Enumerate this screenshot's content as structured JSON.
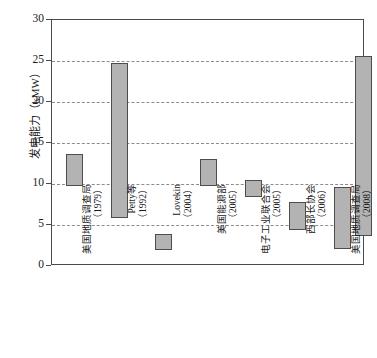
{
  "chart_data": {
    "type": "bar",
    "title": "",
    "subtitle": "",
    "xlabel": "",
    "ylabel": "发电能力（kMW）",
    "ylim": [
      0,
      30
    ],
    "yticks": [
      0,
      5,
      10,
      15,
      20,
      25,
      30
    ],
    "ytick_labels": [
      "0",
      "5",
      "10",
      "15",
      "20",
      "25",
      "30"
    ],
    "grid": true,
    "grid_axis": "y",
    "legend": false,
    "bar_style": "floating-range",
    "note": "Each bar is a floating range bar showing a low and high estimate.",
    "categories": [
      "美国地质调查局（1979）",
      "Petty等（1992）",
      "Lovekin（2004）",
      "美国能源部（2005）",
      "电子工业联合会（2005）",
      "西部长协会（2006）",
      "美国地质调查局（2008）"
    ],
    "category_lines": [
      {
        "name": "美国地质调查局",
        "year": "（1979）"
      },
      {
        "name": "Petty等",
        "year": "（1992）"
      },
      {
        "name": "Lovekin",
        "year": "（2004）"
      },
      {
        "name": "美国能源部",
        "year": "（2005）"
      },
      {
        "name": "电子工业联合会",
        "year": "（2005）"
      },
      {
        "name": "西部长协会",
        "year": "（2006）"
      },
      {
        "name": "美国地质调查局",
        "year": "（2008）"
      }
    ],
    "series": [
      {
        "name": "低值",
        "values": [
          9.7,
          5.8,
          1.9,
          9.8,
          8.4,
          4.4,
          2.1
        ]
      },
      {
        "name": "高值",
        "values": [
          13.6,
          24.7,
          3.9,
          13.0,
          10.5,
          7.8,
          9.6
        ]
      }
    ],
    "bars": [
      {
        "category": "美国地质调查局（1979）",
        "low": 9.7,
        "high": 13.6
      },
      {
        "category": "Petty等（1992）",
        "low": 5.8,
        "high": 24.7
      },
      {
        "category": "Lovekin（2004）",
        "low": 1.9,
        "high": 3.9
      },
      {
        "category": "美国能源部（2005）",
        "low": 9.8,
        "high": 13.0
      },
      {
        "category": "电子工业联合会（2005）",
        "low": 8.4,
        "high": 10.5
      },
      {
        "category": "西部长协会（2006）",
        "low": 4.4,
        "high": 7.8
      },
      {
        "category": "美国地质调查局（2008）",
        "low": 2.1,
        "high": 9.6
      }
    ],
    "extra_bar": {
      "category": "美国地质调查局（2008）",
      "low": 3.7,
      "high": 25.6
    },
    "colors": {
      "bar_fill": "#b3b3b3",
      "bar_border": "#4d4d4d",
      "grid": "#8c8c8c",
      "axis": "#4a4a4a",
      "text": "#1a1a1a",
      "background": "#ffffff"
    }
  }
}
